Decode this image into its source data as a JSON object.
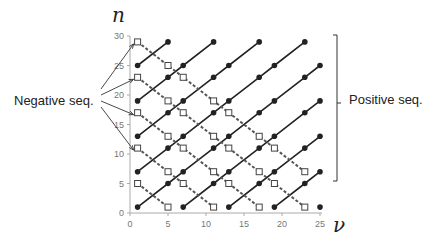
{
  "figure": {
    "y_axis_label": "n",
    "x_axis_label": "ν",
    "left_annotation": "Negative seq.",
    "right_annotation": "Positive seq.",
    "x_ticks": [
      "0",
      "5",
      "10",
      "15",
      "20",
      "25"
    ],
    "y_ticks": [
      "0",
      "5",
      "10",
      "15",
      "20",
      "25",
      "30"
    ],
    "colors": {
      "line": "#222222",
      "dashed": "#555555",
      "axis": "#aaaaaa"
    }
  },
  "chart_data": {
    "type": "scatter",
    "title": "",
    "xlabel": "ν",
    "ylabel": "n",
    "xlim": [
      0,
      25
    ],
    "ylim": [
      0,
      30
    ],
    "grid": false,
    "series": [
      {
        "name": "Positive seq.",
        "style": "solid line, filled circle",
        "lines": [
          [
            [
              1,
              25
            ],
            [
              5,
              29
            ]
          ],
          [
            [
              1,
              19
            ],
            [
              5,
              23
            ],
            [
              7,
              25
            ],
            [
              11,
              29
            ]
          ],
          [
            [
              1,
              13
            ],
            [
              5,
              17
            ],
            [
              7,
              19
            ],
            [
              11,
              23
            ],
            [
              13,
              25
            ],
            [
              17,
              29
            ]
          ],
          [
            [
              1,
              7
            ],
            [
              5,
              11
            ],
            [
              7,
              13
            ],
            [
              11,
              17
            ],
            [
              13,
              19
            ],
            [
              17,
              23
            ],
            [
              19,
              25
            ],
            [
              23,
              29
            ]
          ],
          [
            [
              1,
              1
            ],
            [
              5,
              5
            ],
            [
              7,
              7
            ],
            [
              11,
              11
            ],
            [
              13,
              13
            ],
            [
              17,
              17
            ],
            [
              19,
              19
            ],
            [
              23,
              23
            ],
            [
              25,
              25
            ]
          ],
          [
            [
              7,
              1
            ],
            [
              11,
              5
            ],
            [
              13,
              7
            ],
            [
              17,
              11
            ],
            [
              19,
              13
            ],
            [
              23,
              17
            ],
            [
              25,
              19
            ]
          ],
          [
            [
              13,
              1
            ],
            [
              17,
              5
            ],
            [
              19,
              7
            ],
            [
              23,
              11
            ],
            [
              25,
              13
            ]
          ],
          [
            [
              19,
              1
            ],
            [
              23,
              5
            ],
            [
              25,
              7
            ]
          ],
          [
            [
              25,
              1
            ]
          ]
        ]
      },
      {
        "name": "Negative seq.",
        "style": "dashed line, open square",
        "lines": [
          [
            [
              1,
              29
            ],
            [
              5,
              25
            ],
            [
              7,
              23
            ],
            [
              11,
              19
            ],
            [
              13,
              17
            ],
            [
              17,
              13
            ],
            [
              19,
              11
            ],
            [
              23,
              7
            ]
          ],
          [
            [
              1,
              23
            ],
            [
              5,
              19
            ],
            [
              7,
              17
            ],
            [
              11,
              13
            ],
            [
              13,
              11
            ],
            [
              17,
              7
            ],
            [
              19,
              5
            ],
            [
              23,
              1
            ]
          ],
          [
            [
              1,
              17
            ],
            [
              5,
              13
            ],
            [
              7,
              11
            ],
            [
              11,
              7
            ],
            [
              13,
              5
            ],
            [
              17,
              1
            ]
          ],
          [
            [
              1,
              11
            ],
            [
              5,
              7
            ],
            [
              7,
              5
            ],
            [
              11,
              1
            ]
          ],
          [
            [
              1,
              5
            ],
            [
              5,
              1
            ]
          ]
        ]
      }
    ]
  }
}
